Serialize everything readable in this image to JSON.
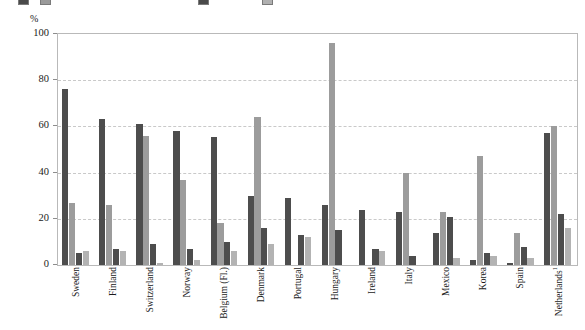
{
  "legend": {
    "visible_note": "legend row is clipped at the very top edge of the screenshot",
    "entries": [
      {
        "label": "",
        "color": "#4a4a4a"
      },
      {
        "label": "",
        "color": "#9a9a9a"
      },
      {
        "label": "",
        "color": "#4a4a4a"
      },
      {
        "label": "",
        "color": "#b0b0b0"
      }
    ]
  },
  "axis": {
    "y_unit": "%",
    "y_ticks": [
      "0",
      "20",
      "40",
      "60",
      "80",
      "100"
    ]
  },
  "chart_data": {
    "type": "bar",
    "title": "",
    "xlabel": "",
    "ylabel": "%",
    "ylim": [
      0,
      100
    ],
    "grid": true,
    "legend_position": "top",
    "categories": [
      "Sweden",
      "Finland",
      "Switzerland",
      "Norway",
      "Belgium (Fl.)",
      "Denmark",
      "Portugal",
      "Hungary",
      "Ireland",
      "Italy",
      "Mexico",
      "Korea",
      "Spain",
      "Netherlands¹"
    ],
    "series": [
      {
        "name": "Series 1",
        "color": "#4d4d4d",
        "values": [
          76,
          63,
          61,
          58,
          55.5,
          30,
          29,
          26,
          24,
          23,
          14,
          2,
          1,
          57
        ]
      },
      {
        "name": "Series 2",
        "color": "#9c9c9c",
        "values": [
          27,
          26,
          56,
          37,
          18,
          64,
          0,
          96,
          0,
          40,
          23,
          47,
          14,
          60
        ]
      },
      {
        "name": "Series 3",
        "color": "#4d4d4d",
        "values": [
          5,
          7,
          9,
          7,
          10,
          16,
          13,
          15,
          7,
          4,
          21,
          5,
          8,
          22
        ]
      },
      {
        "name": "Series 4",
        "color": "#b3b3b3",
        "values": [
          6,
          6,
          1,
          2,
          6,
          9,
          12,
          0,
          6,
          0,
          3,
          4,
          3,
          16
        ]
      }
    ]
  }
}
